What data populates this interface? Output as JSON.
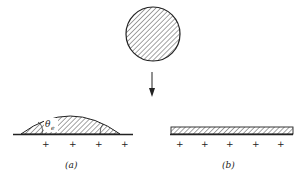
{
  "figure": {
    "panel_a": {
      "label": "(a)",
      "angle_symbol": "θ",
      "angle_subscript": "e",
      "charges": [
        "+",
        "+",
        "+",
        "+"
      ]
    },
    "panel_b": {
      "label": "(b)",
      "charges": [
        "+",
        "+",
        "+",
        "+",
        "+"
      ]
    },
    "colors": {
      "ink": "#222222",
      "background": "#ffffff"
    }
  }
}
